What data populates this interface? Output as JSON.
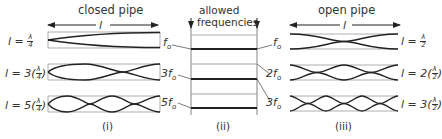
{
  "closed_pipe": {
    "title": "closed pipe",
    "length_symbol": "l",
    "caption": "(i)",
    "modes": [
      {
        "label_prefix": "l = ",
        "multiplier": "",
        "frac_num": "λ",
        "frac_den": "4",
        "frequency": "f₀",
        "quarter_waves": 1
      },
      {
        "label_prefix": "l = 3(",
        "multiplier": "3",
        "frac_num": "λ",
        "frac_den": "4",
        "label_suffix": ")",
        "frequency": "3f₀",
        "quarter_waves": 3
      },
      {
        "label_prefix": "l = 5(",
        "multiplier": "5",
        "frac_num": "λ",
        "frac_den": "4",
        "label_suffix": ")",
        "frequency": "5f₀",
        "quarter_waves": 5
      }
    ]
  },
  "allowed_frequencies": {
    "title_line1": "allowed",
    "title_line2": "frequencies",
    "caption": "(ii)",
    "levels": [
      "f₀",
      "2f₀",
      "3f₀",
      "4f₀",
      "5f₀"
    ]
  },
  "open_pipe": {
    "title": "open pipe",
    "length_symbol": "l",
    "caption": "(iii)",
    "modes": [
      {
        "label_prefix": "l = ",
        "frac_num": "λ",
        "frac_den": "2",
        "frequency": "f₀",
        "half_waves": 1
      },
      {
        "label_prefix": "l = 2(",
        "frac_num": "λ",
        "frac_den": "2",
        "label_suffix": ")",
        "frequency": "2f₀",
        "half_waves": 2
      },
      {
        "label_prefix": "l = 3(",
        "frac_num": "λ",
        "frac_den": "2",
        "label_suffix": ")",
        "frequency": "3f₀",
        "half_waves": 3
      }
    ]
  },
  "labels": {
    "closed_f1": "f",
    "closed_f3": "3f",
    "closed_f5": "5f",
    "open_f1": "f",
    "open_f2": "2f",
    "open_f3": "3f",
    "sub": "o"
  },
  "colors": {
    "line": "#222222",
    "box": "#888888"
  }
}
